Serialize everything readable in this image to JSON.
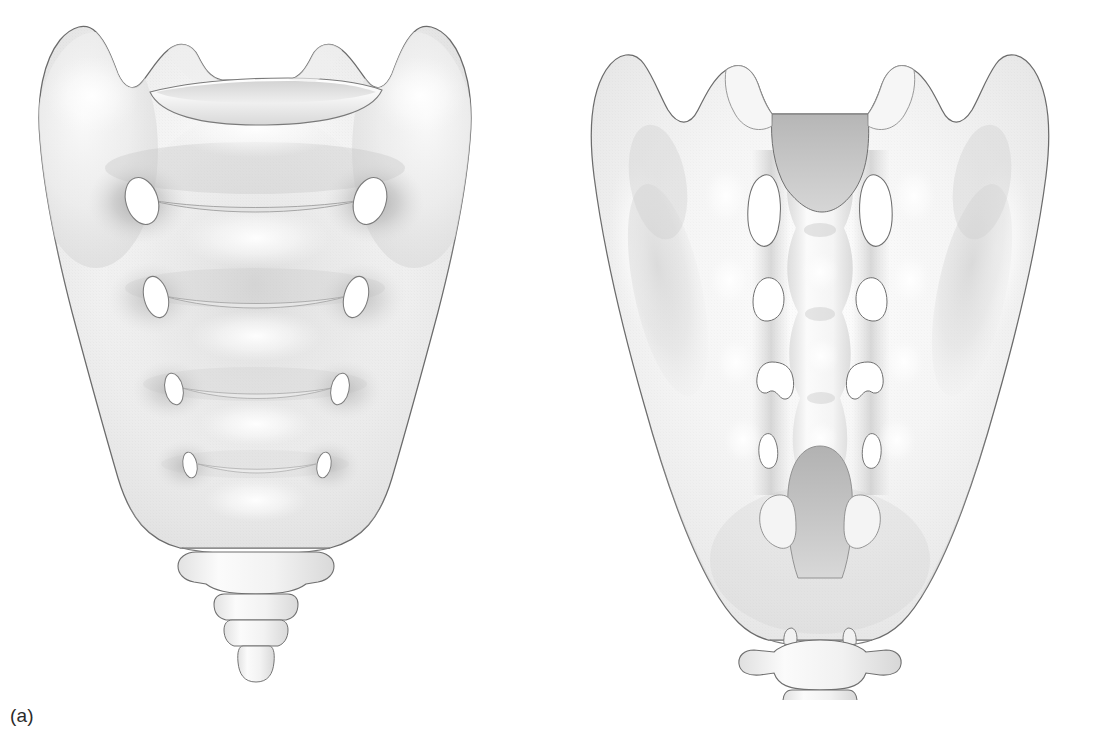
{
  "figure": {
    "background_color": "#ffffff",
    "ink_color": "#4a4a4a",
    "bone_base_color": "#f0f0f0",
    "bone_shadow_color": "#b9b9b9",
    "bone_highlight_color": "#fcfcfc",
    "foramen_fill": "#ffffff",
    "canal_shadow_color": "#c6c6c6",
    "label_color": "#2b2b2b"
  },
  "panels": [
    {
      "key": "anterior",
      "label": "(a)",
      "view_name": "anterior-view",
      "bone": "sacrum-and-coccyx",
      "foramina_count": 4,
      "foramina_shape": "oval",
      "transverse_ridges": 4,
      "coccyx_segments": 4,
      "features": [
        "sacral-promontory",
        "ala-of-sacrum-left",
        "ala-of-sacrum-right",
        "superior-articular-process-left",
        "superior-articular-process-right",
        "body-of-first-sacral-vertebra",
        "anterior-sacral-foramen-s1-left",
        "anterior-sacral-foramen-s1-right",
        "anterior-sacral-foramen-s2-left",
        "anterior-sacral-foramen-s2-right",
        "anterior-sacral-foramen-s3-left",
        "anterior-sacral-foramen-s3-right",
        "anterior-sacral-foramen-s4-left",
        "anterior-sacral-foramen-s4-right",
        "transverse-ridge-s1-s2",
        "transverse-ridge-s2-s3",
        "transverse-ridge-s3-s4",
        "transverse-ridge-s4-s5",
        "apex-of-sacrum",
        "coccyx"
      ]
    },
    {
      "key": "posterior",
      "label": "(b)",
      "view_name": "posterior-view",
      "bone": "sacrum-and-coccyx",
      "foramina_count": 4,
      "foramina_shape": "irregular-bean",
      "coccyx_segments": 4,
      "features": [
        "superior-articular-process-left",
        "superior-articular-process-right",
        "sacral-canal-opening",
        "median-sacral-crest",
        "intermediate-sacral-crest-left",
        "intermediate-sacral-crest-right",
        "lateral-sacral-crest-left",
        "lateral-sacral-crest-right",
        "auricular-surface-left",
        "auricular-surface-right",
        "posterior-sacral-foramen-s1-left",
        "posterior-sacral-foramen-s1-right",
        "posterior-sacral-foramen-s2-left",
        "posterior-sacral-foramen-s2-right",
        "posterior-sacral-foramen-s3-left",
        "posterior-sacral-foramen-s3-right",
        "posterior-sacral-foramen-s4-left",
        "posterior-sacral-foramen-s4-right",
        "sacral-hiatus",
        "sacral-cornu-left",
        "sacral-cornu-right",
        "coccyx",
        "coccygeal-cornu-left",
        "coccygeal-cornu-right",
        "transverse-process-of-coccyx-left",
        "transverse-process-of-coccyx-right"
      ]
    }
  ]
}
